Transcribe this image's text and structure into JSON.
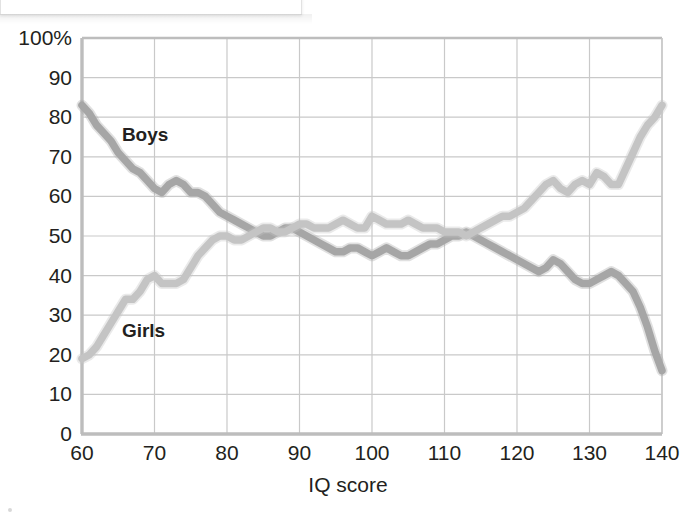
{
  "figure": {
    "background_color": "#ffffff",
    "axis_color": "#b6b6b6",
    "grid_color": "#c9c9c9",
    "text_color": "#231f20"
  },
  "axes": {
    "x_title": "IQ score",
    "y_top_label": "100%",
    "x_ticks": [
      "60",
      "70",
      "80",
      "90",
      "100",
      "110",
      "120",
      "130",
      "140"
    ],
    "y_ticks": [
      "100%",
      "90",
      "80",
      "70",
      "60",
      "50",
      "40",
      "30",
      "20",
      "10",
      "0"
    ]
  },
  "legend": {
    "boys_label": "Boys",
    "girls_label": "Girls"
  },
  "chart_data": {
    "type": "line",
    "title": "",
    "subtitle": "",
    "xlabel": "IQ score",
    "ylabel": "",
    "xlim": [
      60,
      140
    ],
    "ylim": [
      0,
      100
    ],
    "xticks": [
      60,
      70,
      80,
      90,
      100,
      110,
      120,
      130,
      140
    ],
    "yticks": [
      0,
      10,
      20,
      30,
      40,
      50,
      60,
      70,
      80,
      90,
      100
    ],
    "y_tick_labels": [
      "0",
      "10",
      "20",
      "30",
      "40",
      "50",
      "60",
      "70",
      "80",
      "90",
      "100%"
    ],
    "grid": true,
    "legend": "inline-annotations",
    "annotations": [
      {
        "text": "Boys",
        "x": 65.5,
        "y": 75.5
      },
      {
        "text": "Girls",
        "x": 65.5,
        "y": 26.0
      }
    ],
    "colors": {
      "Boys": "#a6a6a6",
      "Girls": "#c4c4c4"
    },
    "x": [
      60,
      61,
      62,
      63,
      64,
      65,
      66,
      67,
      68,
      69,
      70,
      71,
      72,
      73,
      74,
      75,
      76,
      77,
      78,
      79,
      80,
      81,
      82,
      83,
      84,
      85,
      86,
      87,
      88,
      89,
      90,
      91,
      92,
      93,
      94,
      95,
      96,
      97,
      98,
      99,
      100,
      101,
      102,
      103,
      104,
      105,
      106,
      107,
      108,
      109,
      110,
      111,
      112,
      113,
      114,
      115,
      116,
      117,
      118,
      119,
      120,
      121,
      122,
      123,
      124,
      125,
      126,
      127,
      128,
      129,
      130,
      131,
      132,
      133,
      134,
      135,
      136,
      137,
      138,
      139,
      140
    ],
    "series": [
      {
        "name": "Boys",
        "values": [
          83,
          81,
          78,
          76,
          74,
          71,
          69,
          67,
          66,
          64,
          62,
          61,
          63,
          64,
          63,
          61,
          61,
          60,
          58,
          56,
          55,
          54,
          53,
          52,
          51,
          50,
          50,
          51,
          52,
          52,
          51,
          50,
          49,
          48,
          47,
          46,
          46,
          47,
          47,
          46,
          45,
          46,
          47,
          46,
          45,
          45,
          46,
          47,
          48,
          48,
          49,
          50,
          50,
          51,
          50,
          49,
          48,
          47,
          46,
          45,
          44,
          43,
          42,
          41,
          42,
          44,
          43,
          41,
          39,
          38,
          38,
          39,
          40,
          41,
          40,
          38,
          36,
          32,
          27,
          21,
          16
        ]
      },
      {
        "name": "Girls",
        "values": [
          19,
          20,
          22,
          25,
          28,
          31,
          34,
          34,
          36,
          39,
          40,
          38,
          38,
          38,
          39,
          42,
          45,
          47,
          49,
          50,
          50,
          49,
          49,
          50,
          51,
          52,
          52,
          51,
          51,
          52,
          53,
          53,
          52,
          52,
          52,
          53,
          54,
          53,
          52,
          52,
          55,
          54,
          53,
          53,
          53,
          54,
          53,
          52,
          52,
          52,
          51,
          51,
          51,
          50,
          51,
          52,
          53,
          54,
          55,
          55,
          56,
          57,
          59,
          61,
          63,
          64,
          62,
          61,
          63,
          64,
          63,
          66,
          65,
          63,
          63,
          67,
          71,
          75,
          78,
          80,
          83
        ]
      }
    ]
  }
}
